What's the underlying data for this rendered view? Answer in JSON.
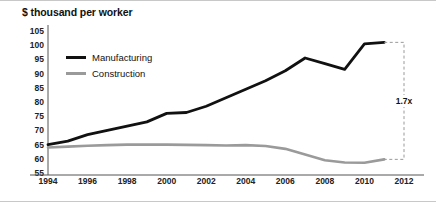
{
  "title": "$ thousand per worker",
  "legend": {
    "manufacturing": "Manufacturing",
    "construction": "Construction"
  },
  "annotation": {
    "ratio_label": "1.7x"
  },
  "colors": {
    "manufacturing": "#111111",
    "construction": "#9a9a9a",
    "axis": "#555555",
    "annotation": "#999999",
    "frame": "#c8c8c8"
  },
  "chart_data": {
    "type": "line",
    "title": "$ thousand per worker",
    "xlabel": "",
    "ylabel": "$ thousand per worker",
    "xlim": [
      1994,
      2012
    ],
    "ylim": [
      55,
      105
    ],
    "ytick_step": 5,
    "yticks": [
      105,
      100,
      95,
      90,
      85,
      80,
      75,
      70,
      65,
      60,
      55
    ],
    "xticks": [
      1994,
      1996,
      1998,
      2000,
      2002,
      2004,
      2006,
      2008,
      2010,
      2012
    ],
    "grid": false,
    "legend_position": "upper-left-inside",
    "x": [
      1994,
      1995,
      1996,
      1997,
      1998,
      1999,
      2000,
      2001,
      2002,
      2003,
      2004,
      2005,
      2006,
      2007,
      2008,
      2009,
      2010,
      2011
    ],
    "series": [
      {
        "name": "Manufacturing",
        "color": "#111111",
        "values": [
          65.0,
          66.2,
          68.5,
          70.0,
          71.5,
          73.0,
          76.0,
          76.3,
          78.5,
          81.5,
          84.5,
          87.5,
          91.0,
          95.5,
          93.5,
          91.5,
          100.5,
          101.0
        ]
      },
      {
        "name": "Construction",
        "color": "#9a9a9a",
        "values": [
          64.0,
          64.3,
          64.6,
          64.8,
          65.0,
          65.0,
          65.0,
          64.9,
          64.8,
          64.7,
          64.8,
          64.5,
          63.5,
          61.5,
          59.5,
          58.7,
          58.6,
          59.8
        ]
      }
    ],
    "annotations": [
      {
        "type": "bracket",
        "label": "1.7x",
        "x": 2012,
        "y_top": 101.0,
        "y_bottom": 59.8,
        "style": "dashed",
        "description": "Dashed bracket at right edge spanning the 2011 Manufacturing value down to the 2011 Construction value, labelled 1.7x"
      }
    ]
  }
}
